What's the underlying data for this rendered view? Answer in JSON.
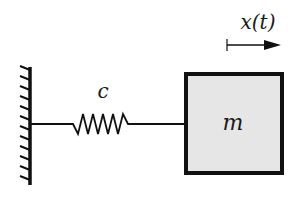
{
  "diagram": {
    "labels": {
      "damper": "c",
      "mass": "m",
      "displacement": "x(t)"
    },
    "colors": {
      "stroke": "#111111",
      "mass_fill": "#e6e6e6",
      "background": "#ffffff"
    }
  }
}
